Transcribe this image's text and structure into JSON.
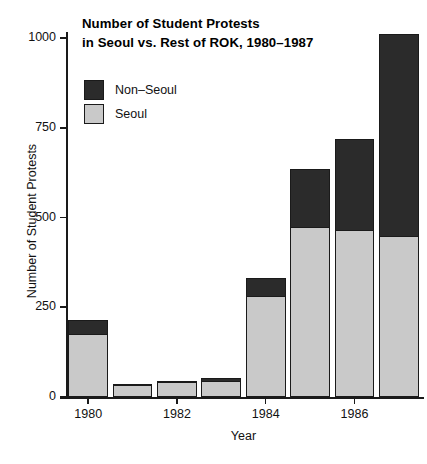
{
  "chart_data": {
    "type": "bar",
    "subtype": "stacked-bar",
    "title": "Number of Student Protests\nin Seoul vs. Rest of ROK, 1980–1987",
    "title_line1": "Number of Student Protests",
    "title_line2": "in Seoul vs. Rest of ROK, 1980–1987",
    "xlabel": "Year",
    "ylabel": "Number of Student Protests",
    "categories": [
      1980,
      1981,
      1982,
      1983,
      1984,
      1985,
      1986,
      1987
    ],
    "x_tick_labels": [
      "1980",
      "1982",
      "1984",
      "1986"
    ],
    "x_tick_values": [
      1980,
      1982,
      1984,
      1986
    ],
    "y_tick_labels": [
      "0",
      "250",
      "500",
      "750",
      "1000"
    ],
    "y_tick_values": [
      0,
      250,
      500,
      750,
      1000
    ],
    "ylim": [
      0,
      1012
    ],
    "xlim": [
      1979.5,
      1987.5
    ],
    "grid": false,
    "legend_position": "upper-left-inside",
    "series": [
      {
        "name": "Seoul",
        "color": "#c9c9c9",
        "values": [
          175,
          34,
          42,
          46,
          281,
          474,
          466,
          450
        ]
      },
      {
        "name": "Non–Seoul",
        "color": "#2b2b2b",
        "values": [
          40,
          2,
          3,
          7,
          51,
          160,
          254,
          562
        ]
      }
    ],
    "stack_order_bottom_to_top": [
      "Seoul",
      "Non–Seoul"
    ],
    "totals": [
      215,
      36,
      45,
      53,
      332,
      634,
      720,
      1012
    ]
  },
  "legend": {
    "items": [
      {
        "label": "Non–Seoul",
        "color": "#2b2b2b"
      },
      {
        "label": "Seoul",
        "color": "#c9c9c9"
      }
    ]
  },
  "colors": {
    "seoul": "#c9c9c9",
    "non_seoul": "#2b2b2b",
    "axis": "#1a1a1a",
    "background": "#ffffff"
  }
}
